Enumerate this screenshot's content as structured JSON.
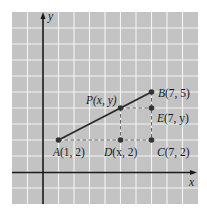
{
  "figure": {
    "axes": {
      "x_label": "x",
      "y_label": "y"
    },
    "grid": {
      "background": "#c3c3c3",
      "line_color": "#f4f4f4",
      "unit_px_x": 15.5,
      "unit_px_y": 16,
      "origin_px": [
        43,
        172
      ],
      "x_range": [
        -2,
        10
      ],
      "y_range": [
        -2,
        10
      ]
    },
    "points": [
      {
        "id": "A",
        "label": "A(1, 2)",
        "name": "A",
        "coords": "(1, 2)",
        "x": 1,
        "y": 2
      },
      {
        "id": "B",
        "label": "B(7, 5)",
        "name": "B",
        "coords": "(7, 5)",
        "x": 7,
        "y": 5
      },
      {
        "id": "P",
        "label": "P(x, y)",
        "name": "P",
        "coords": "(x, y)",
        "x": 5,
        "y": 4
      },
      {
        "id": "D",
        "label": "D(x, 2)",
        "name": "D",
        "coords": "(x, 2)",
        "x": 5,
        "y": 2
      },
      {
        "id": "C",
        "label": "C(7, 2)",
        "name": "C",
        "coords": "(7, 2)",
        "x": 7,
        "y": 2
      },
      {
        "id": "E",
        "label": "E(7, y)",
        "name": "E",
        "coords": "(7, y)",
        "x": 7,
        "y": 4
      }
    ],
    "segments": [
      {
        "from": "A",
        "to": "B",
        "style": "solid"
      },
      {
        "from": "A",
        "to": "C",
        "style": "dashed"
      },
      {
        "from": "P",
        "to": "D",
        "style": "dashed"
      },
      {
        "from": "P",
        "to": "E",
        "style": "dashed"
      },
      {
        "from": "B",
        "to": "C",
        "style": "dashed"
      }
    ],
    "colors": {
      "axis": "#1a1a1a",
      "segment": "#2a2a2a",
      "point": "#333333",
      "dash": "#555555"
    }
  }
}
